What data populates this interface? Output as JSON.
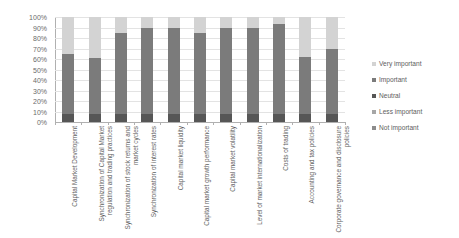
{
  "chart_data": {
    "type": "bar",
    "subtype": "stacked-bar-100-percent",
    "title": "",
    "xlabel": "",
    "ylabel": "",
    "ylim": [
      0,
      100
    ],
    "y_tick_labels": [
      "0%",
      "10%",
      "20%",
      "30%",
      "40%",
      "50%",
      "60%",
      "70%",
      "80%",
      "90%",
      "100%"
    ],
    "y_tick_values": [
      0,
      10,
      20,
      30,
      40,
      50,
      60,
      70,
      80,
      90,
      100
    ],
    "grid": true,
    "legend_position": "right",
    "categories": [
      "Capital Market Development",
      "Synchronization of Capital Market regulation and trading practices",
      "Synchronization of stock returns and market cycles",
      "Synchronization of interest rates",
      "Capital market liquidity",
      "Capital market growth performance",
      "Capital market volatility",
      "Level of market internationalization",
      "Costs of trading",
      "Accounting and tax policies",
      "Corporate governance and disclosure policies"
    ],
    "series": [
      {
        "name": "Not important",
        "color": "#8c8c8c",
        "values": [
          0,
          0,
          0,
          0,
          0,
          0,
          0,
          0,
          0,
          0,
          0
        ]
      },
      {
        "name": "Less important",
        "color": "#a6a6a6",
        "values": [
          0,
          0,
          0,
          0,
          0,
          0,
          0,
          0,
          0,
          0,
          0
        ]
      },
      {
        "name": "Neutral",
        "color": "#565656",
        "values": [
          8,
          8,
          8,
          8,
          8,
          8,
          8,
          8,
          8,
          8,
          8
        ]
      },
      {
        "name": "Important",
        "color": "#7b7b7b",
        "values": [
          57,
          53,
          77,
          82,
          82,
          77,
          82,
          82,
          85,
          54,
          62
        ]
      },
      {
        "name": "Very important",
        "color": "#d3d3d3",
        "values": [
          35,
          39,
          15,
          10,
          10,
          15,
          10,
          10,
          7,
          38,
          30
        ]
      }
    ]
  },
  "legend": {
    "items": [
      {
        "label": "Very important",
        "color": "#d3d3d3"
      },
      {
        "label": "Important",
        "color": "#7b7b7b"
      },
      {
        "label": "Neutral",
        "color": "#565656"
      },
      {
        "label": "Less important",
        "color": "#a6a6a6"
      },
      {
        "label": "Not important",
        "color": "#8c8c8c"
      }
    ]
  }
}
